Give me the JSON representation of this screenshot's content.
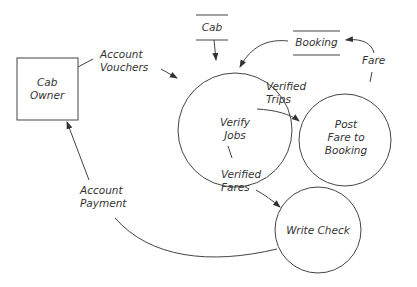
{
  "diagram": {
    "type": "data-flow-diagram",
    "external_entities": [
      {
        "id": "cab_owner",
        "label": "Cab\nOwner"
      }
    ],
    "processes": [
      {
        "id": "verify_jobs",
        "label": "Verify\nJobs"
      },
      {
        "id": "post_fare",
        "label": "Post\nFare to\nBooking"
      },
      {
        "id": "write_check",
        "label": "Write Check"
      }
    ],
    "data_stores": [
      {
        "id": "cab",
        "label": "Cab"
      },
      {
        "id": "booking",
        "label": "Booking"
      }
    ],
    "flows": [
      {
        "from": "cab_owner",
        "to": "verify_jobs",
        "label": "Account\nVouchers"
      },
      {
        "from": "cab",
        "to": "verify_jobs",
        "label": ""
      },
      {
        "from": "booking",
        "to": "verify_jobs",
        "label": ""
      },
      {
        "from": "verify_jobs",
        "to": "post_fare",
        "label": "Verified\nTrips"
      },
      {
        "from": "post_fare",
        "to": "booking",
        "label": "Fare"
      },
      {
        "from": "verify_jobs",
        "to": "write_check",
        "label": "Verified\nFares"
      },
      {
        "from": "write_check",
        "to": "cab_owner",
        "label": "Account\nPayment"
      }
    ],
    "colors": {
      "stroke": "#444444",
      "text": "#333333",
      "background": "#ffffff"
    }
  }
}
